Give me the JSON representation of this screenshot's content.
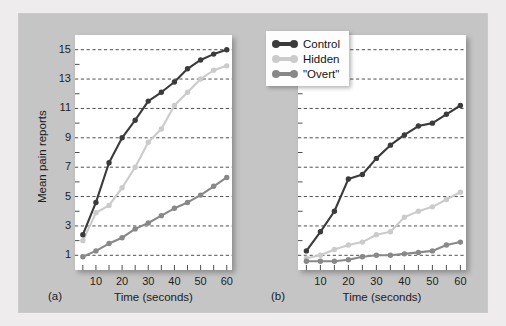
{
  "figure": {
    "caption_a": "(a)",
    "caption_b": "(b)"
  },
  "legend": {
    "items": [
      {
        "label": "Control",
        "color": "#3b3b3b"
      },
      {
        "label": "Hidden",
        "color": "#cbcbcb"
      },
      {
        "label": "\"Overt\"",
        "color": "#888888"
      }
    ]
  },
  "colors": {
    "control": "#3b3b3b",
    "hidden": "#cbcbcb",
    "overt": "#888888",
    "plate": "#c6c5c5",
    "mat": "#eeecec",
    "canvas": "#ffffff",
    "gridline": "#3a3a3a",
    "axis_text": "#1d1d1d"
  },
  "chart_data": [
    {
      "type": "line",
      "panel": "(a)",
      "title": "",
      "xlabel": "Time (seconds)",
      "ylabel": "Mean pain reports",
      "xlim": [
        2,
        62
      ],
      "ylim": [
        0,
        16
      ],
      "xticks": [
        10,
        20,
        30,
        40,
        50,
        60
      ],
      "xminorticks": [
        5,
        15,
        25,
        35,
        45,
        55
      ],
      "yticks": [
        1,
        3,
        5,
        7,
        9,
        11,
        13,
        15
      ],
      "yminorticks": [
        2,
        4,
        6,
        8,
        10,
        12,
        14
      ],
      "grid": true,
      "legend_position": "none",
      "x": [
        5,
        10,
        15,
        20,
        25,
        30,
        35,
        40,
        45,
        50,
        55,
        60
      ],
      "series": [
        {
          "name": "Control",
          "color": "#3b3b3b",
          "values": [
            2.4,
            4.6,
            7.3,
            9.0,
            10.2,
            11.5,
            12.1,
            12.8,
            13.7,
            14.3,
            14.7,
            15.0
          ]
        },
        {
          "name": "Hidden",
          "color": "#cbcbcb",
          "values": [
            2.0,
            3.9,
            4.4,
            5.6,
            7.0,
            8.7,
            9.6,
            11.2,
            12.1,
            13.0,
            13.6,
            13.9
          ]
        },
        {
          "name": "\"Overt\"",
          "color": "#888888",
          "values": [
            0.9,
            1.3,
            1.8,
            2.2,
            2.8,
            3.2,
            3.7,
            4.2,
            4.6,
            5.1,
            5.7,
            6.3
          ]
        }
      ]
    },
    {
      "type": "line",
      "panel": "(b)",
      "title": "",
      "xlabel": "Time (seconds)",
      "ylabel": "Mean pain reports",
      "xlim": [
        2,
        62
      ],
      "ylim": [
        0,
        16
      ],
      "xticks": [
        10,
        20,
        30,
        40,
        50,
        60
      ],
      "xminorticks": [
        5,
        15,
        25,
        35,
        45,
        55
      ],
      "yticks": [
        1,
        3,
        5,
        7,
        9,
        11,
        13,
        15
      ],
      "yminorticks": [
        2,
        4,
        6,
        8,
        10,
        12,
        14
      ],
      "grid": true,
      "legend_position": "top-left",
      "x": [
        5,
        10,
        15,
        20,
        25,
        30,
        35,
        40,
        45,
        50,
        55,
        60
      ],
      "series": [
        {
          "name": "Control",
          "color": "#3b3b3b",
          "values": [
            1.3,
            2.6,
            4.0,
            6.2,
            6.5,
            7.6,
            8.5,
            9.2,
            9.8,
            10.0,
            10.6,
            11.2
          ]
        },
        {
          "name": "Hidden",
          "color": "#cbcbcb",
          "values": [
            0.8,
            1.0,
            1.4,
            1.7,
            1.9,
            2.4,
            2.6,
            3.6,
            4.0,
            4.3,
            4.8,
            5.3
          ]
        },
        {
          "name": "\"Overt\"",
          "color": "#888888",
          "values": [
            0.6,
            0.6,
            0.6,
            0.7,
            0.9,
            1.0,
            1.0,
            1.1,
            1.2,
            1.3,
            1.7,
            1.9
          ]
        }
      ]
    }
  ]
}
